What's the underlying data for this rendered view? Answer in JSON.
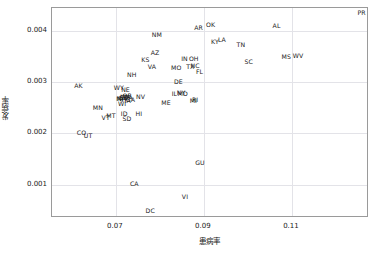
{
  "chart_data": {
    "type": "scatter",
    "title": "",
    "xlabel": "患病率",
    "ylabel": "发病率",
    "xlim": [
      0.0555,
      0.1275
    ],
    "ylim": [
      0.00035,
      0.00445
    ],
    "xticks": [
      0.07,
      0.09,
      0.11
    ],
    "xticklabels": [
      "0.07",
      "0.09",
      "0.11"
    ],
    "yticks": [
      0.001,
      0.002,
      0.003,
      0.004
    ],
    "yticklabels": [
      "0.001",
      "0.002",
      "0.003",
      "0.004"
    ],
    "grid": true,
    "legend": "none",
    "marker": "text-label",
    "points": [
      {
        "label": "PR",
        "x": 0.1258,
        "y": 0.00435
      },
      {
        "label": "OK",
        "x": 0.0915,
        "y": 0.00412
      },
      {
        "label": "AL",
        "x": 0.1065,
        "y": 0.0041
      },
      {
        "label": "AR",
        "x": 0.0888,
        "y": 0.00405
      },
      {
        "label": "NM",
        "x": 0.0793,
        "y": 0.00392
      },
      {
        "label": "LA",
        "x": 0.0941,
        "y": 0.00382
      },
      {
        "label": "KY",
        "x": 0.0925,
        "y": 0.00379
      },
      {
        "label": "TN",
        "x": 0.0984,
        "y": 0.00373
      },
      {
        "label": "AZ",
        "x": 0.0789,
        "y": 0.00358
      },
      {
        "label": "WV",
        "x": 0.1114,
        "y": 0.00352
      },
      {
        "label": "MS",
        "x": 0.1087,
        "y": 0.00349
      },
      {
        "label": "OH",
        "x": 0.0877,
        "y": 0.00346
      },
      {
        "label": "IN",
        "x": 0.0856,
        "y": 0.00345
      },
      {
        "label": "KS",
        "x": 0.0767,
        "y": 0.00343
      },
      {
        "label": "SC",
        "x": 0.1002,
        "y": 0.00339
      },
      {
        "label": "NC",
        "x": 0.088,
        "y": 0.00331
      },
      {
        "label": "TX",
        "x": 0.0869,
        "y": 0.0033
      },
      {
        "label": "VA",
        "x": 0.0782,
        "y": 0.0033
      },
      {
        "label": "MO",
        "x": 0.0837,
        "y": 0.00327
      },
      {
        "label": "FL",
        "x": 0.089,
        "y": 0.0032
      },
      {
        "label": "NH",
        "x": 0.0736,
        "y": 0.00315
      },
      {
        "label": "DE",
        "x": 0.0842,
        "y": 0.00301
      },
      {
        "label": "AK",
        "x": 0.0615,
        "y": 0.00292
      },
      {
        "label": "WY",
        "x": 0.0707,
        "y": 0.00288
      },
      {
        "label": "NE",
        "x": 0.0722,
        "y": 0.00285
      },
      {
        "label": "NY",
        "x": 0.0848,
        "y": 0.00279
      },
      {
        "label": "MD",
        "x": 0.0852,
        "y": 0.00278
      },
      {
        "label": "IL",
        "x": 0.0833,
        "y": 0.00277
      },
      {
        "label": "OR",
        "x": 0.0726,
        "y": 0.00274
      },
      {
        "label": "WA",
        "x": 0.0722,
        "y": 0.00272
      },
      {
        "label": "NV",
        "x": 0.0756,
        "y": 0.00272
      },
      {
        "label": "PA",
        "x": 0.073,
        "y": 0.0027
      },
      {
        "label": "SD",
        "x": 0.0719,
        "y": 0.0027
      },
      {
        "label": "CT",
        "x": 0.0716,
        "y": 0.00269
      },
      {
        "label": "MA",
        "x": 0.0712,
        "y": 0.00268
      },
      {
        "label": "NJ",
        "x": 0.071,
        "y": 0.00267
      },
      {
        "label": "GA",
        "x": 0.0733,
        "y": 0.00265
      },
      {
        "label": "IA",
        "x": 0.0727,
        "y": 0.00263
      },
      {
        "label": "RI",
        "x": 0.088,
        "y": 0.00266
      },
      {
        "label": "MI",
        "x": 0.0876,
        "y": 0.00264
      },
      {
        "label": "ME",
        "x": 0.0814,
        "y": 0.00259
      },
      {
        "label": "WI",
        "x": 0.0714,
        "y": 0.00257
      },
      {
        "label": "MN",
        "x": 0.0659,
        "y": 0.00249
      },
      {
        "label": "ID",
        "x": 0.0719,
        "y": 0.00239
      },
      {
        "label": "HI",
        "x": 0.0752,
        "y": 0.00239
      },
      {
        "label": "MT",
        "x": 0.0689,
        "y": 0.00234
      },
      {
        "label": "VT",
        "x": 0.0677,
        "y": 0.00231
      },
      {
        "label": "SD",
        "x": 0.0725,
        "y": 0.00228
      },
      {
        "label": "CO",
        "x": 0.0622,
        "y": 0.002
      },
      {
        "label": "UT",
        "x": 0.0637,
        "y": 0.00196
      },
      {
        "label": "GU",
        "x": 0.0891,
        "y": 0.00143
      },
      {
        "label": "CA",
        "x": 0.0742,
        "y": 0.00101
      },
      {
        "label": "VI",
        "x": 0.0857,
        "y": 0.00076
      },
      {
        "label": "DC",
        "x": 0.0778,
        "y": 0.00048
      }
    ]
  }
}
